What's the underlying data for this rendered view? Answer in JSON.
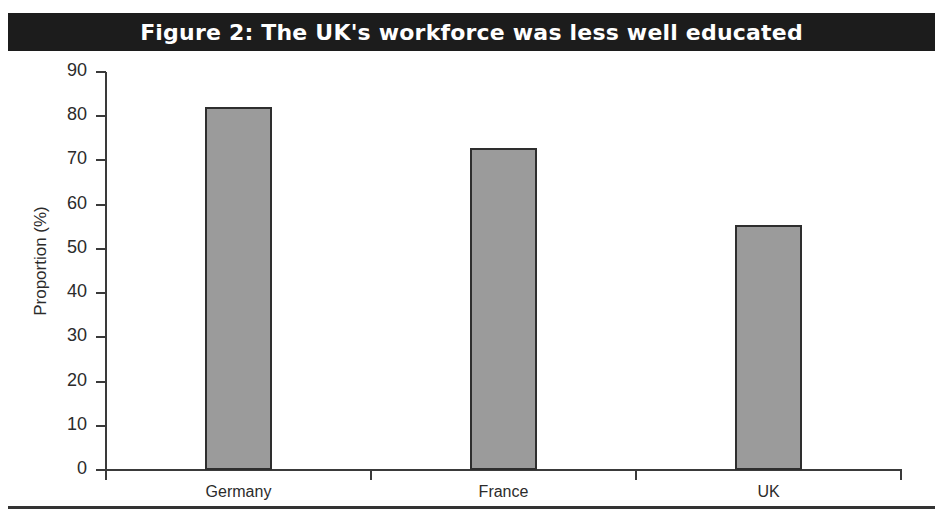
{
  "figure": {
    "title": "Figure 2: The UK's workforce was less well educated"
  },
  "colors": {
    "title_band_bg": "#1c1c1c",
    "title_text": "#ffffff",
    "bar_fill": "#9b9b9b",
    "bar_border": "#2e2e2e",
    "axis": "#3a3a3a",
    "text": "#2b2b2b",
    "background": "#ffffff"
  },
  "chart_data": {
    "type": "bar",
    "title": "Figure 2: The UK's workforce was less well educated",
    "categories": [
      "Germany",
      "France",
      "UK"
    ],
    "values": [
      82,
      72.8,
      55.5
    ],
    "xlabel": "",
    "ylabel": "Proportion (%)",
    "ylim": [
      0,
      90
    ],
    "ytick_labels": [
      "0",
      "10",
      "20",
      "30",
      "40",
      "50",
      "60",
      "70",
      "80",
      "90"
    ],
    "ytick_values": [
      0,
      10,
      20,
      30,
      40,
      50,
      60,
      70,
      80,
      90
    ],
    "grid": false,
    "legend": "none"
  }
}
